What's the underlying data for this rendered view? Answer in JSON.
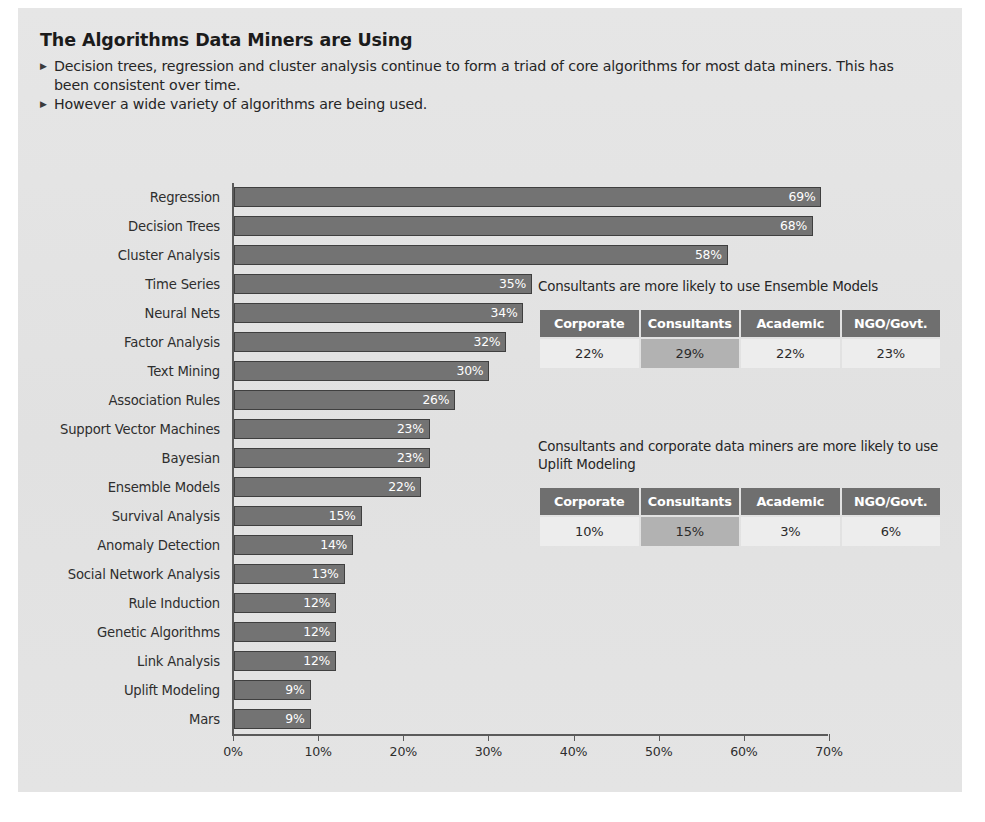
{
  "header": {
    "title": "The Algorithms Data Miners are Using",
    "bullets": [
      "Decision trees, regression and cluster analysis continue to form a triad of core algorithms for most data miners. This has been consistent over time.",
      "However a wide variety of algorithms are being used."
    ],
    "bullet_glyph": "▶"
  },
  "chart_data": {
    "type": "bar",
    "orientation": "horizontal",
    "title": "The Algorithms Data Miners are Using",
    "xlabel": "",
    "ylabel": "",
    "xlim": [
      0,
      70
    ],
    "xticks": [
      0,
      10,
      20,
      30,
      40,
      50,
      60,
      70
    ],
    "xtick_labels": [
      "0%",
      "10%",
      "20%",
      "30%",
      "40%",
      "50%",
      "60%",
      "70%"
    ],
    "grid": false,
    "legend": null,
    "bar_color": "#737373",
    "bar_edge_color": "#3f3f3f",
    "value_label_color": "#ffffff",
    "categories": [
      "Regression",
      "Decision Trees",
      "Cluster Analysis",
      "Time Series",
      "Neural Nets",
      "Factor Analysis",
      "Text Mining",
      "Association Rules",
      "Support Vector Machines",
      "Bayesian",
      "Ensemble Models",
      "Survival Analysis",
      "Anomaly Detection",
      "Social Network Analysis",
      "Rule Induction",
      "Genetic Algorithms",
      "Link Analysis",
      "Uplift Modeling",
      "Mars"
    ],
    "values": [
      69,
      68,
      58,
      35,
      34,
      32,
      30,
      26,
      23,
      23,
      22,
      15,
      14,
      13,
      12,
      12,
      12,
      9,
      9
    ],
    "value_labels": [
      "69%",
      "68%",
      "58%",
      "35%",
      "34%",
      "32%",
      "30%",
      "26%",
      "23%",
      "23%",
      "22%",
      "15%",
      "14%",
      "13%",
      "12%",
      "12%",
      "12%",
      "9%",
      "9%"
    ]
  },
  "side_tables": [
    {
      "caption": "Consultants are more likely to use Ensemble Models",
      "columns": [
        "Corporate",
        "Consultants",
        "Academic",
        "NGO/Govt."
      ],
      "values": [
        "22%",
        "29%",
        "22%",
        "23%"
      ],
      "highlight_index": 1
    },
    {
      "caption": "Consultants and corporate data miners are more likely to use Uplift Modeling",
      "columns": [
        "Corporate",
        "Consultants",
        "Academic",
        "NGO/Govt."
      ],
      "values": [
        "10%",
        "15%",
        "3%",
        "6%"
      ],
      "highlight_index": 1
    }
  ],
  "colors": {
    "panel_bg": "#e3e3e3",
    "bar": "#737373",
    "table_header": "#6f6f6f",
    "table_cell": "#ededed",
    "table_highlight": "#b2b2b2",
    "axis": "#5a5a5a"
  }
}
